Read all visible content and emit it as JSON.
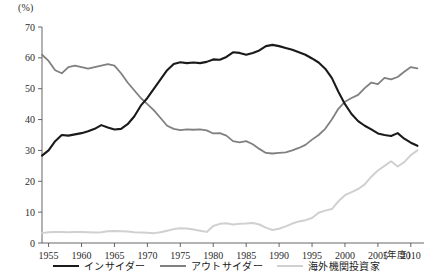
{
  "chart_data": {
    "type": "line",
    "title": "",
    "xlabel": "(年度)",
    "ylabel": "(%)",
    "unit_label": "(%)",
    "xlim": [
      1954,
      2012
    ],
    "ylim": [
      0,
      70
    ],
    "grid": false,
    "legend_position": "bottom",
    "y_ticks": [
      "0",
      "10",
      "20",
      "30",
      "40",
      "50",
      "60",
      "70"
    ],
    "y_tick_values": [
      0,
      10,
      20,
      30,
      40,
      50,
      60,
      70
    ],
    "x_ticks": [
      "1955",
      "1960",
      "1965",
      "1970",
      "1975",
      "1980",
      "1985",
      "1990",
      "1995",
      "2000",
      "2005",
      "2010"
    ],
    "x_tick_values": [
      1955,
      1960,
      1965,
      1970,
      1975,
      1980,
      1985,
      1990,
      1995,
      2000,
      2005,
      2010
    ],
    "x": [
      1954,
      1955,
      1956,
      1957,
      1958,
      1959,
      1960,
      1961,
      1962,
      1963,
      1964,
      1965,
      1966,
      1967,
      1968,
      1969,
      1970,
      1971,
      1972,
      1973,
      1974,
      1975,
      1976,
      1977,
      1978,
      1979,
      1980,
      1981,
      1982,
      1983,
      1984,
      1985,
      1986,
      1987,
      1988,
      1989,
      1990,
      1991,
      1992,
      1993,
      1994,
      1995,
      1996,
      1997,
      1998,
      1999,
      2000,
      2001,
      2002,
      2003,
      2004,
      2005,
      2006,
      2007,
      2008,
      2009,
      2010,
      2011
    ],
    "series": [
      {
        "name": "インサイダー",
        "color": "#1a1a1a",
        "width": 2.1,
        "values": [
          28.3,
          30.0,
          33.0,
          35.0,
          34.8,
          35.2,
          35.6,
          36.2,
          37.0,
          38.2,
          37.4,
          36.8,
          37.0,
          38.5,
          41.0,
          44.5,
          47.0,
          50.0,
          53.0,
          56.0,
          58.0,
          58.6,
          58.3,
          58.5,
          58.3,
          58.7,
          59.5,
          59.4,
          60.3,
          61.8,
          61.6,
          61.0,
          61.6,
          62.4,
          63.8,
          64.2,
          63.8,
          63.2,
          62.6,
          61.8,
          61.0,
          59.8,
          58.5,
          56.5,
          53.5,
          49.0,
          45.0,
          41.8,
          39.5,
          38.0,
          36.8,
          35.5,
          35.0,
          34.7,
          35.6,
          33.8,
          32.5,
          31.5
        ]
      },
      {
        "name": "アウトサイダー",
        "color": "#808080",
        "width": 1.8,
        "values": [
          61.0,
          59.0,
          56.0,
          55.0,
          57.0,
          57.5,
          57.0,
          56.5,
          57.0,
          57.5,
          58.0,
          57.5,
          55.0,
          52.0,
          49.5,
          47.0,
          45.0,
          43.0,
          40.5,
          38.0,
          37.0,
          36.6,
          36.8,
          36.7,
          36.8,
          36.5,
          35.5,
          35.6,
          34.8,
          33.0,
          32.6,
          33.0,
          32.0,
          30.5,
          29.2,
          29.0,
          29.2,
          29.4,
          30.0,
          30.8,
          31.8,
          33.5,
          35.0,
          37.0,
          40.0,
          43.5,
          45.8,
          47.0,
          48.0,
          50.2,
          52.0,
          51.5,
          53.5,
          53.0,
          53.8,
          55.5,
          57.0,
          56.6
        ]
      },
      {
        "name": "海外機関投資家",
        "color": "#d0d0d0",
        "width": 2.0,
        "values": [
          3.2,
          3.5,
          3.6,
          3.6,
          3.5,
          3.6,
          3.6,
          3.5,
          3.4,
          3.5,
          3.8,
          3.9,
          3.8,
          3.7,
          3.5,
          3.4,
          3.3,
          3.2,
          3.5,
          4.0,
          4.5,
          4.8,
          4.7,
          4.4,
          4.0,
          3.6,
          5.5,
          6.2,
          6.4,
          6.0,
          6.2,
          6.3,
          6.5,
          6.0,
          5.0,
          4.2,
          4.6,
          5.4,
          6.3,
          7.0,
          7.4,
          8.1,
          9.8,
          10.5,
          11.0,
          13.5,
          15.5,
          16.5,
          17.5,
          19.0,
          21.5,
          23.5,
          25.0,
          26.5,
          24.8,
          26.2,
          28.5,
          30.0
        ]
      }
    ]
  }
}
